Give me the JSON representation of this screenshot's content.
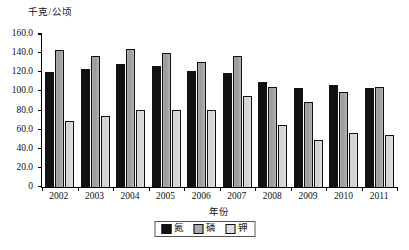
{
  "chart_data": {
    "type": "bar",
    "title": "",
    "xlabel": "年份",
    "ylabel": "千克/公顷",
    "ylim": [
      0,
      160
    ],
    "ytick_labels": [
      "0",
      "20.0",
      "40.0",
      "60.0",
      "80.0",
      "100.0",
      "120.0",
      "140.0",
      "160.0"
    ],
    "ytick_values": [
      0,
      20,
      40,
      60,
      80,
      100,
      120,
      140,
      160
    ],
    "grid": false,
    "legend_position": "bottom-center",
    "categories": [
      "2002",
      "2003",
      "2004",
      "2005",
      "2006",
      "2007",
      "2008",
      "2009",
      "2010",
      "2011"
    ],
    "series": [
      {
        "name": "氮",
        "color": "#111111",
        "values": [
          120.4,
          123.6,
          128.3,
          126.5,
          121.8,
          119.2,
          109.3,
          103.5,
          107.2,
          103.8
        ]
      },
      {
        "name": "磷",
        "color": "#a9a9a9",
        "values": [
          143.6,
          137.2,
          144.4,
          140.1,
          130.8,
          137.0,
          104.2,
          88.9,
          99.4,
          104.8
        ]
      },
      {
        "name": "钾",
        "color": "#dedede",
        "values": [
          68.8,
          74.2,
          80.6,
          80.9,
          80.5,
          95.4,
          64.9,
          49.2,
          57.0,
          54.3
        ]
      }
    ]
  }
}
